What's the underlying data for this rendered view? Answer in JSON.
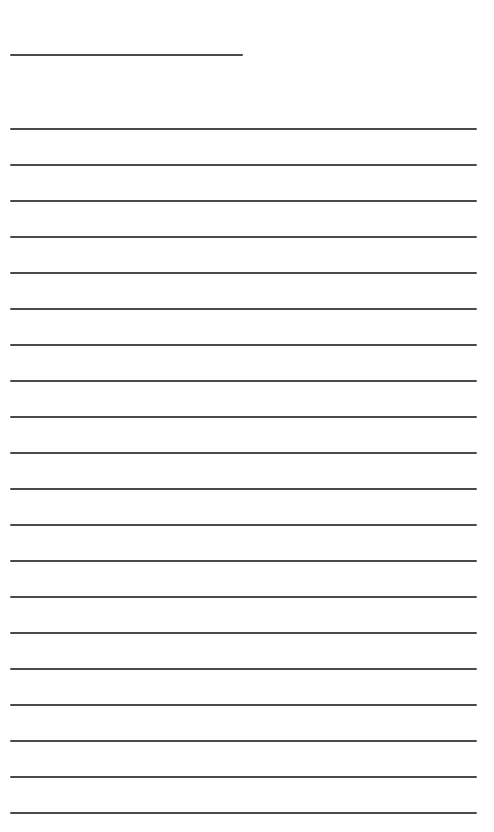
{
  "page": {
    "type": "blank-lined-paper",
    "background_color": "#ffffff",
    "line_color": "#4a4a4a"
  },
  "header_line": {
    "x_start": 10,
    "x_end": 243,
    "y": 54
  },
  "ruled_lines": {
    "count": 20,
    "x_start": 10,
    "x_end": 477,
    "first_y": 128,
    "spacing": 36
  }
}
